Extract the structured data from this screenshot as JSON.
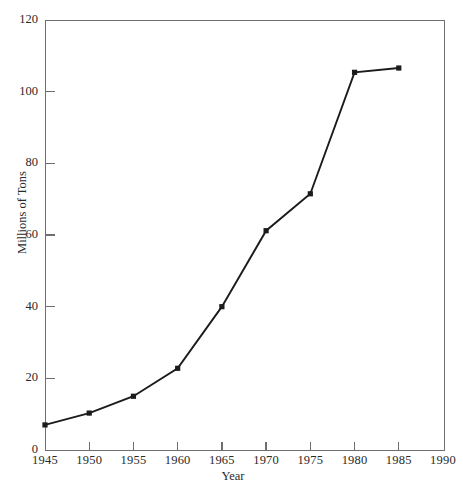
{
  "chart_data": {
    "type": "line",
    "title": "",
    "xlabel": "Year",
    "ylabel": "Millions of Tons",
    "xlim": [
      1945,
      1990
    ],
    "ylim": [
      0,
      120
    ],
    "xticks": [
      1945,
      1950,
      1955,
      1960,
      1965,
      1970,
      1975,
      1980,
      1985,
      1990
    ],
    "xtick_labels": [
      "1945",
      "1950",
      "1955",
      "1960",
      "1965",
      "1970",
      "1975",
      "1980",
      "1985",
      "1990"
    ],
    "yticks": [
      0,
      20,
      40,
      60,
      80,
      100,
      120
    ],
    "ytick_labels": [
      "0",
      "20",
      "40",
      "60",
      "80",
      "100",
      "120"
    ],
    "grid": false,
    "legend": "none",
    "marker": "filled-square",
    "line_color": "#1b1b1b",
    "marker_color": "#1b1b1b",
    "axis_color": "#6f6f6f",
    "background": "#ffffff",
    "x": [
      1945,
      1950,
      1955,
      1960,
      1965,
      1970,
      1975,
      1980,
      1985
    ],
    "values": [
      7,
      10.3,
      15,
      22.8,
      40,
      61.2,
      71.5,
      105.4,
      106.6
    ],
    "series": [
      {
        "name": "Millions of Tons",
        "x": [
          1945,
          1950,
          1955,
          1960,
          1965,
          1970,
          1975,
          1980,
          1985
        ],
        "values": [
          7,
          10.3,
          15,
          22.8,
          40,
          61.2,
          71.5,
          105.4,
          106.6
        ]
      }
    ],
    "annotations": []
  },
  "axes": {
    "y_title": "Millions of Tons",
    "x_title": "Year"
  }
}
